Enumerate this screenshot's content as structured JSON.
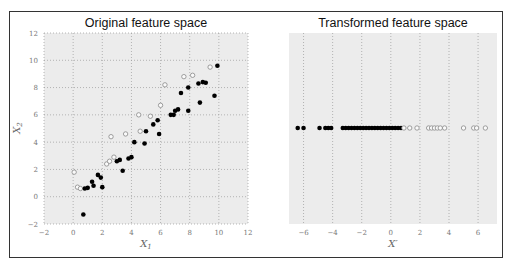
{
  "chart_data": [
    {
      "type": "scatter",
      "title": "Original feature space",
      "xlabel": "X_1",
      "ylabel": "X_2",
      "xlim": [
        -2,
        12
      ],
      "ylim": [
        -2,
        12
      ],
      "xticks": [
        -2,
        0,
        2,
        4,
        6,
        8,
        10,
        12
      ],
      "yticks": [
        -2,
        0,
        2,
        4,
        6,
        8,
        10,
        12
      ],
      "grid": true,
      "series": [
        {
          "name": "class_open",
          "marker": "open-circle",
          "points": [
            [
              0.07,
              1.8
            ],
            [
              0.3,
              0.7
            ],
            [
              0.5,
              0.6
            ],
            [
              2.3,
              2.4
            ],
            [
              2.5,
              2.6
            ],
            [
              2.6,
              4.4
            ],
            [
              2.8,
              2.9
            ],
            [
              3.6,
              4.6
            ],
            [
              4.6,
              4.8
            ],
            [
              4.5,
              6.0
            ],
            [
              5.3,
              5.9
            ],
            [
              6.0,
              6.7
            ],
            [
              6.3,
              8.2
            ],
            [
              7.6,
              8.8
            ],
            [
              8.2,
              8.9
            ],
            [
              9.4,
              9.5
            ]
          ]
        },
        {
          "name": "class_filled",
          "marker": "filled-circle",
          "points": [
            [
              0.7,
              -1.3
            ],
            [
              0.8,
              0.6
            ],
            [
              1.0,
              0.65
            ],
            [
              1.3,
              1.1
            ],
            [
              1.4,
              0.8
            ],
            [
              1.7,
              1.6
            ],
            [
              1.9,
              1.4
            ],
            [
              2.0,
              0.7
            ],
            [
              3.0,
              2.6
            ],
            [
              3.2,
              2.7
            ],
            [
              3.4,
              1.9
            ],
            [
              3.8,
              2.8
            ],
            [
              4.0,
              2.9
            ],
            [
              4.2,
              4.0
            ],
            [
              4.9,
              3.9
            ],
            [
              5.0,
              4.8
            ],
            [
              5.5,
              5.3
            ],
            [
              5.8,
              5.6
            ],
            [
              5.9,
              4.6
            ],
            [
              6.7,
              6.0
            ],
            [
              6.9,
              6.0
            ],
            [
              7.0,
              6.3
            ],
            [
              7.2,
              6.4
            ],
            [
              7.4,
              7.6
            ],
            [
              7.9,
              6.3
            ],
            [
              7.9,
              8.0
            ],
            [
              8.6,
              8.3
            ],
            [
              8.7,
              6.9
            ],
            [
              8.9,
              8.4
            ],
            [
              9.1,
              8.35
            ],
            [
              9.7,
              7.4
            ],
            [
              9.9,
              9.6
            ]
          ]
        }
      ]
    },
    {
      "type": "scatter",
      "title": "Transformed feature space",
      "xlabel": "X'",
      "ylabel": "",
      "xlim": [
        -7,
        7.3
      ],
      "xticks": [
        -6,
        -4,
        -2,
        0,
        2,
        4,
        6
      ],
      "grid": true,
      "series": [
        {
          "name": "class_filled",
          "marker": "filled-circle",
          "x": [
            -6.4,
            -6.0,
            -4.9,
            -4.5,
            -4.3,
            -4.1,
            -3.3,
            -3.1,
            -2.9,
            -2.7,
            -2.5,
            -2.3,
            -2.1,
            -1.9,
            -1.7,
            -1.5,
            -1.3,
            -1.1,
            -0.9,
            -0.7,
            -0.5,
            -0.3,
            -0.1,
            0.1,
            0.3,
            0.5,
            0.7
          ]
        },
        {
          "name": "class_open",
          "marker": "open-circle",
          "x": [
            0.9,
            1.3,
            1.8,
            2.6,
            2.8,
            3.0,
            3.2,
            3.4,
            3.7,
            5.0,
            5.7,
            5.9,
            6.5
          ]
        }
      ]
    }
  ],
  "plots": {
    "left": {
      "title": "Original feature space",
      "xlabel": "X",
      "xlabel_sub": "1",
      "ylabel": "X",
      "ylabel_sub": "2"
    },
    "right": {
      "title": "Transformed feature space",
      "xlabel": "X′"
    }
  },
  "colors": {
    "plot_bg": "#ececec",
    "grid": "#999999",
    "filled": "#000000",
    "open_stroke": "#888888",
    "frame": "#333333"
  }
}
